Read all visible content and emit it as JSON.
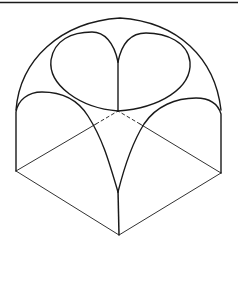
{
  "diagram": {
    "stroke_color": "#1a1a1a",
    "background": "#ffffff",
    "elements": {
      "top_rule": "horizontal border line at top",
      "outer_dome": "outer dome arc",
      "left_lobe": "left upper lobe",
      "right_lobe": "right upper lobe",
      "left_arch": "left side arch",
      "right_arch": "right side arch",
      "front_arch_left": "front arch left rib",
      "front_arch_right": "front arch right rib",
      "base_square": "square base in isometric",
      "hidden_edges": "dashed back edges"
    }
  }
}
